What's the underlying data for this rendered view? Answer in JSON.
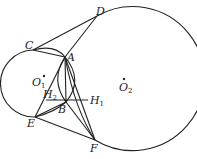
{
  "diagram": {
    "type": "geometry",
    "circles": [
      {
        "name": "O1",
        "cx": 40,
        "cy": 86,
        "r": 28
      },
      {
        "name": "O2",
        "cx": 124,
        "cy": 84,
        "r": 72
      }
    ],
    "points": {
      "A": {
        "x": 65,
        "y": 57,
        "label": "A"
      },
      "B": {
        "x": 66,
        "y": 102,
        "label": "B"
      },
      "C": {
        "x": 33,
        "y": 50,
        "label": "C"
      },
      "D": {
        "x": 97,
        "y": 16,
        "label": "D"
      },
      "E": {
        "x": 35,
        "y": 117,
        "label": "E"
      },
      "F": {
        "x": 95,
        "y": 140,
        "label": "F"
      },
      "H1": {
        "x": 88,
        "y": 102,
        "label": "H",
        "sub": "1"
      },
      "H2": {
        "x": 46,
        "y": 102,
        "label": "H",
        "sub": "2"
      },
      "O1": {
        "x": 44,
        "y": 76,
        "label": "O",
        "sub": "1"
      },
      "O2": {
        "x": 124,
        "y": 84,
        "label": "O",
        "sub": "2"
      }
    },
    "segments": [
      [
        "C",
        "D"
      ],
      [
        "C",
        "A"
      ],
      [
        "D",
        "A"
      ],
      [
        "E",
        "F"
      ],
      [
        "A",
        "E"
      ],
      [
        "A",
        "F"
      ],
      [
        "D",
        "B"
      ],
      [
        "E",
        "B"
      ],
      [
        "F",
        "B"
      ],
      [
        "H2",
        "H1"
      ]
    ]
  }
}
